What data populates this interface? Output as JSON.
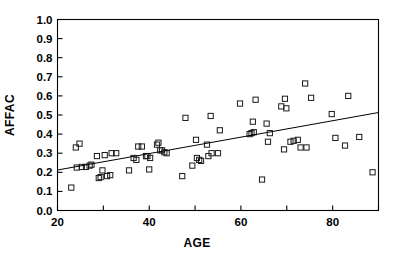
{
  "chart_data": {
    "type": "scatter",
    "title": "",
    "xlabel": "AGE",
    "ylabel": "AFFAC",
    "xlim": [
      20,
      90
    ],
    "ylim": [
      0.0,
      1.0
    ],
    "grid": false,
    "legend": null,
    "x_ticks": [
      20,
      30,
      40,
      50,
      60,
      70,
      80,
      90
    ],
    "x_tick_labels": [
      "20",
      "",
      "40",
      "",
      "60",
      "",
      "80",
      ""
    ],
    "y_ticks": [
      0.0,
      0.1,
      0.2,
      0.3,
      0.4,
      0.5,
      0.6,
      0.7,
      0.8,
      0.9,
      1.0
    ],
    "y_tick_labels": [
      "0.0",
      "0.1",
      "0.2",
      "0.3",
      "0.4",
      "0.5",
      "0.6",
      "0.7",
      "0.8",
      "0.9",
      "1.0"
    ],
    "marker": "open-square",
    "points": [
      [
        23.0,
        0.12
      ],
      [
        24.0,
        0.33
      ],
      [
        24.8,
        0.35
      ],
      [
        24.2,
        0.225
      ],
      [
        25.3,
        0.228
      ],
      [
        26.2,
        0.228
      ],
      [
        27.0,
        0.235
      ],
      [
        27.4,
        0.24
      ],
      [
        28.6,
        0.285
      ],
      [
        29.0,
        0.17
      ],
      [
        29.4,
        0.175
      ],
      [
        29.8,
        0.21
      ],
      [
        30.3,
        0.29
      ],
      [
        30.8,
        0.18
      ],
      [
        31.5,
        0.185
      ],
      [
        31.8,
        0.3
      ],
      [
        32.8,
        0.3
      ],
      [
        35.6,
        0.21
      ],
      [
        36.6,
        0.275
      ],
      [
        37.2,
        0.265
      ],
      [
        37.6,
        0.335
      ],
      [
        38.4,
        0.335
      ],
      [
        39.3,
        0.285
      ],
      [
        39.6,
        0.285
      ],
      [
        40.0,
        0.215
      ],
      [
        40.2,
        0.275
      ],
      [
        41.7,
        0.345
      ],
      [
        42.0,
        0.355
      ],
      [
        42.4,
        0.315
      ],
      [
        42.8,
        0.315
      ],
      [
        43.3,
        0.305
      ],
      [
        43.8,
        0.3
      ],
      [
        47.2,
        0.18
      ],
      [
        47.9,
        0.485
      ],
      [
        49.4,
        0.235
      ],
      [
        50.2,
        0.37
      ],
      [
        50.4,
        0.275
      ],
      [
        50.9,
        0.265
      ],
      [
        51.3,
        0.26
      ],
      [
        52.6,
        0.345
      ],
      [
        52.9,
        0.285
      ],
      [
        53.4,
        0.495
      ],
      [
        53.6,
        0.3
      ],
      [
        55.0,
        0.3
      ],
      [
        55.4,
        0.42
      ],
      [
        59.8,
        0.56
      ],
      [
        61.9,
        0.4
      ],
      [
        62.3,
        0.405
      ],
      [
        62.6,
        0.465
      ],
      [
        62.8,
        0.41
      ],
      [
        63.2,
        0.58
      ],
      [
        64.6,
        0.162
      ],
      [
        65.6,
        0.455
      ],
      [
        65.9,
        0.36
      ],
      [
        66.3,
        0.405
      ],
      [
        68.8,
        0.545
      ],
      [
        69.4,
        0.32
      ],
      [
        69.6,
        0.585
      ],
      [
        69.9,
        0.535
      ],
      [
        70.8,
        0.36
      ],
      [
        71.5,
        0.365
      ],
      [
        72.4,
        0.37
      ],
      [
        73.0,
        0.33
      ],
      [
        74.0,
        0.665
      ],
      [
        74.3,
        0.33
      ],
      [
        75.3,
        0.59
      ],
      [
        79.8,
        0.505
      ],
      [
        80.6,
        0.38
      ],
      [
        82.7,
        0.34
      ],
      [
        83.4,
        0.6
      ],
      [
        85.8,
        0.385
      ],
      [
        88.7,
        0.2
      ]
    ],
    "fit_line": {
      "x_start": 20,
      "y_start": 0.212,
      "x_end": 90,
      "y_end": 0.513
    }
  },
  "axes": {
    "x_title": "AGE",
    "y_title": "AFFAC"
  }
}
